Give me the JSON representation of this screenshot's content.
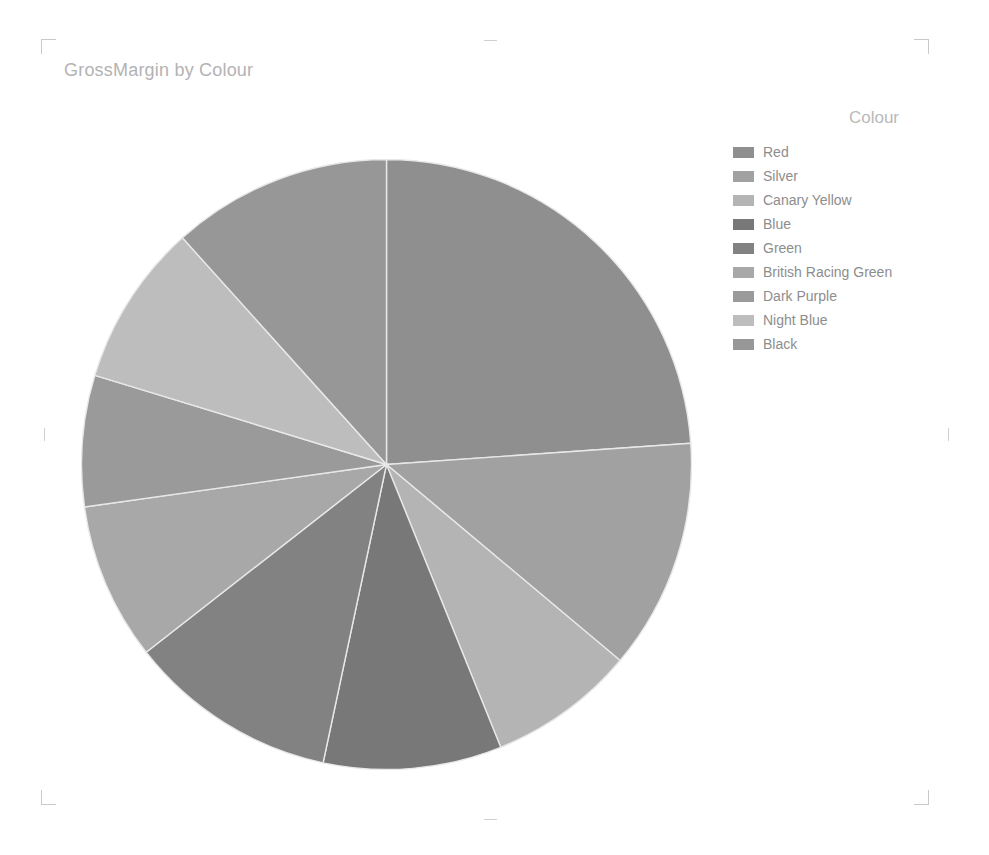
{
  "chart_data": {
    "type": "pie",
    "title": "GrossMargin by Colour",
    "legend_title": "Colour",
    "legend_position": "right",
    "category_field": "Colour",
    "value_field": "GrossMargin",
    "categories": [
      "Red",
      "Silver",
      "Canary Yellow",
      "Blue",
      "Green",
      "British Racing Green",
      "Dark Purple",
      "Night Blue",
      "Black"
    ],
    "values": [
      23.9,
      12.2,
      7.8,
      9.4,
      11.1,
      8.3,
      6.9,
      8.6,
      11.8
    ],
    "units": "percent of total",
    "start_angle_deg": 0,
    "direction": "clockwise",
    "slices": [
      {
        "label": "Red",
        "percent": 23.9,
        "start_deg": 0,
        "end_deg": 86,
        "color": "#8f8f8f"
      },
      {
        "label": "Silver",
        "percent": 12.2,
        "start_deg": 86,
        "end_deg": 130,
        "color": "#a1a1a1"
      },
      {
        "label": "Canary Yellow",
        "percent": 7.8,
        "start_deg": 130,
        "end_deg": 158,
        "color": "#b4b4b4"
      },
      {
        "label": "Blue",
        "percent": 9.4,
        "start_deg": 158,
        "end_deg": 192,
        "color": "#787878"
      },
      {
        "label": "Green",
        "percent": 11.1,
        "start_deg": 192,
        "end_deg": 232,
        "color": "#828282"
      },
      {
        "label": "British Racing Green",
        "percent": 8.3,
        "start_deg": 232,
        "end_deg": 262,
        "color": "#a8a8a8"
      },
      {
        "label": "Dark Purple",
        "percent": 6.9,
        "start_deg": 262,
        "end_deg": 287,
        "color": "#9a9a9a"
      },
      {
        "label": "Night Blue",
        "percent": 8.6,
        "start_deg": 287,
        "end_deg": 318,
        "color": "#bdbdbd"
      },
      {
        "label": "Black",
        "percent": 11.8,
        "start_deg": 318,
        "end_deg": 360,
        "color": "#979797"
      }
    ],
    "slice_border_color": "#e8e8e8",
    "background": "#ffffff"
  },
  "legend": {
    "title": "Colour",
    "items": [
      {
        "label": "Red",
        "color": "#8f8f8f"
      },
      {
        "label": "Silver",
        "color": "#a1a1a1"
      },
      {
        "label": "Canary Yellow",
        "color": "#b4b4b4"
      },
      {
        "label": "Blue",
        "color": "#787878"
      },
      {
        "label": "Green",
        "color": "#828282"
      },
      {
        "label": "British Racing Green",
        "color": "#a8a8a8"
      },
      {
        "label": "Dark Purple",
        "color": "#9a9a9a"
      },
      {
        "label": "Night Blue",
        "color": "#bdbdbd"
      },
      {
        "label": "Black",
        "color": "#979797"
      }
    ]
  },
  "title": {
    "text": "GrossMargin by Colour",
    "color": "#b3b3b3"
  },
  "visual_frame": {
    "corner_mark_color": "#c9c9c9",
    "edge_tick_color": "#cfcfcf"
  }
}
